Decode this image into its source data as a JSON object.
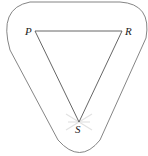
{
  "diagram": {
    "type": "graph-with-enclosing-curve",
    "vertices": [
      {
        "id": "P",
        "label": "P",
        "x": 35,
        "y": 31
      },
      {
        "id": "R",
        "label": "R",
        "x": 122,
        "y": 31
      },
      {
        "id": "S",
        "label": "S",
        "x": 79,
        "y": 122
      }
    ],
    "edges": [
      {
        "from": "P",
        "to": "R"
      },
      {
        "from": "P",
        "to": "S"
      },
      {
        "from": "R",
        "to": "S"
      }
    ],
    "enclosing_curve": "rounded triangular loop surrounding P, R, S",
    "colors": {
      "line": "#555555",
      "curve": "#777777",
      "glare": "#dddddd"
    }
  }
}
